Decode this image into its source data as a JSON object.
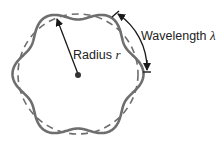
{
  "diagram": {
    "labels": {
      "radius": "Radius",
      "radius_symbol": "r",
      "wavelength": "Wavelength",
      "wavelength_symbol": "λ"
    },
    "geometry": {
      "center": [
        78,
        74
      ],
      "base_radius": 60,
      "wave_count": 6,
      "amplitude": 5.5
    },
    "colors": {
      "wave_stroke": "#6e6e6e",
      "dashed_circle": "#6e6e6e",
      "arrow": "#1a1a1a",
      "text": "#222222",
      "background": "#ffffff"
    }
  }
}
